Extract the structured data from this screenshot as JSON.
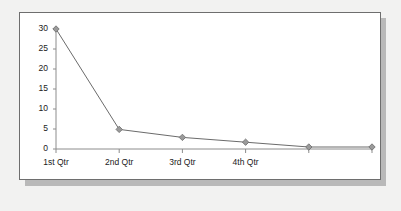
{
  "chart_data": {
    "type": "line",
    "title": "",
    "subtitle": "",
    "xlabel": "",
    "ylabel": "",
    "categories": [
      "1st Qtr",
      "2nd Qtr",
      "3rd Qtr",
      "4th Qtr",
      "",
      ""
    ],
    "x_tick_labels": [
      "1st Qtr",
      "2nd Qtr",
      "3rd Qtr",
      "4th Qtr"
    ],
    "values": [
      30,
      4.9,
      2.9,
      1.7,
      0.5,
      0.5
    ],
    "series": [
      {
        "name": "Series 1",
        "values": [
          30,
          4.9,
          2.9,
          1.7,
          0.5,
          0.5
        ],
        "marker": "diamond",
        "line_color": "#6b6b6b",
        "marker_color": "#9a9a9a"
      }
    ],
    "ylim": [
      0,
      30
    ],
    "y_tick_labels": [
      "0",
      "5",
      "10",
      "15",
      "20",
      "25",
      "30"
    ],
    "y_ticks": [
      0,
      5,
      10,
      15,
      20,
      25,
      30
    ],
    "grid": false,
    "legend": "none",
    "axis_color": "#8c8c8c",
    "background": "#ffffff",
    "page_background": "#f2f2f1",
    "frame_border_color": "#6e6e6e",
    "shadow_color": "#b9b9b9"
  }
}
